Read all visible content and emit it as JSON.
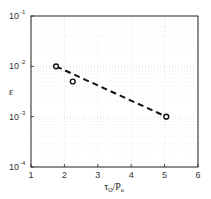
{
  "chart_data": {
    "type": "scatter",
    "title": "",
    "xlabel": "τ_O/P_u",
    "ylabel": "ε",
    "xlim": [
      1,
      6
    ],
    "ylim": [
      0.0001,
      0.1
    ],
    "yscale": "log",
    "grid": true,
    "legend": null,
    "x_ticks": [
      1,
      2,
      3,
      4,
      5,
      6
    ],
    "y_ticks": [
      "10^-1",
      "10^-2",
      "10^-3",
      "10^-4"
    ],
    "series": [
      {
        "name": "data",
        "marker": "circle-open",
        "x": [
          1.75,
          2.25,
          5.05
        ],
        "y": [
          0.01,
          0.005,
          0.001
        ]
      },
      {
        "name": "fit",
        "style": "dashed-line",
        "x": [
          1.75,
          5.05
        ],
        "y": [
          0.01,
          0.001
        ]
      }
    ]
  },
  "axes": {
    "xlabel_main": "τ",
    "xlabel_sub1": "O",
    "xlabel_mid": "/P",
    "xlabel_sub2": "u",
    "ylabel": "ε",
    "x_tick_labels": [
      "1",
      "2",
      "3",
      "4",
      "5",
      "6"
    ],
    "y_tick_base": "10",
    "y_tick_exps": [
      "-1",
      "-2",
      "-3",
      "-4"
    ]
  }
}
